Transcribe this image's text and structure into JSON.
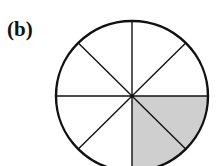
{
  "figure": {
    "label": "(b)",
    "sectors_total": 8,
    "sectors_shaded": 2,
    "fraction_shaded": "2/8",
    "shade_color": "#cfcfcf",
    "line_color": "#111111",
    "background": "#ffffff"
  }
}
